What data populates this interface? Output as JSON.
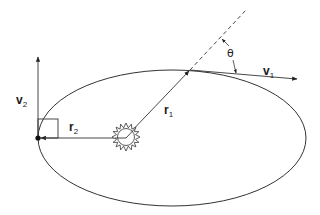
{
  "diagram": {
    "colors": {
      "stroke": "#333333",
      "background": "#ffffff"
    },
    "labels": {
      "v1": {
        "main": "v",
        "sub": "1"
      },
      "v2": {
        "main": "v",
        "sub": "2"
      },
      "r1": {
        "main": "r",
        "sub": "1"
      },
      "r2": {
        "main": "r",
        "sub": "2"
      },
      "theta": "θ"
    },
    "elements": [
      {
        "id": "orbit",
        "type": "ellipse",
        "cx": 172,
        "cy": 138,
        "rx": 134,
        "ry": 68
      },
      {
        "id": "sun",
        "type": "sun-icon",
        "cx": 126,
        "cy": 137,
        "r": 9
      },
      {
        "id": "r1",
        "type": "arrow",
        "from": [
          126,
          137
        ],
        "to": [
          190,
          70
        ]
      },
      {
        "id": "r1-extension",
        "type": "dashed-line",
        "from": [
          190,
          70
        ],
        "to": [
          246,
          10
        ]
      },
      {
        "id": "r2",
        "type": "arrow",
        "from": [
          126,
          138
        ],
        "to": [
          39,
          138
        ]
      },
      {
        "id": "v1",
        "type": "arrow",
        "from": [
          190,
          70
        ],
        "to": [
          297,
          79
        ]
      },
      {
        "id": "v2",
        "type": "arrow",
        "from": [
          38,
          138
        ],
        "to": [
          38,
          57
        ]
      },
      {
        "id": "right-angle",
        "type": "box",
        "x": 38,
        "y": 119,
        "size": 20
      },
      {
        "id": "planet-aphelion",
        "type": "dot",
        "cx": 38,
        "cy": 138
      }
    ]
  }
}
